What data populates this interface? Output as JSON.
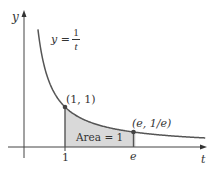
{
  "chart_data": {
    "type": "line",
    "title": "",
    "function": "y = 1/t",
    "xlabel": "t",
    "ylabel": "y",
    "x_ticks": [
      "1",
      "e"
    ],
    "x_tick_values": [
      1,
      2.718
    ],
    "curve_label": {
      "lhs": "y =",
      "numerator": "1",
      "denominator": "t"
    },
    "points": [
      {
        "label": "(1, 1)",
        "x": 1,
        "y": 1
      },
      {
        "label": "(e, 1/e)",
        "x": 2.718,
        "y": 0.368
      }
    ],
    "shaded_region": {
      "from": 1,
      "to": 2.718,
      "label": "Area = 1"
    },
    "xlim": [
      -0.3,
      4.5
    ],
    "ylim": [
      -0.5,
      3.5
    ],
    "grid": false,
    "colors": {
      "curve": "#555555",
      "fill": "#d9d9d9",
      "axis": "#444444",
      "point": "#444444"
    }
  },
  "labels": {
    "y_axis": "y",
    "t_axis": "t",
    "curve_lhs": "y =",
    "curve_num": "1",
    "curve_den": "t",
    "point1": "(1, 1)",
    "point2": "(e, 1/e)",
    "area": "Area = 1",
    "tick1": "1",
    "tick_e": "e"
  }
}
